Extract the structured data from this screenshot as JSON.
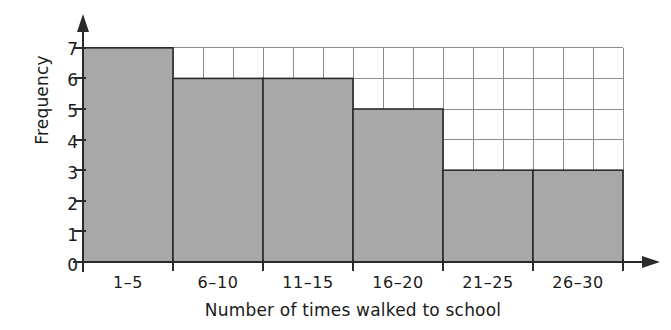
{
  "chart_data": {
    "type": "bar",
    "title": "",
    "subtitle": "",
    "xlabel": "Number of times walked to school",
    "ylabel": "Frequency",
    "categories": [
      "1–5",
      "6–10",
      "11–15",
      "16–20",
      "21–25",
      "26–30"
    ],
    "values": [
      7,
      6,
      6,
      5,
      3,
      3
    ],
    "ylim": [
      0,
      7
    ],
    "y_ticks": [
      0,
      1,
      2,
      3,
      4,
      5,
      6,
      7
    ],
    "y_tick_labels": [
      "0",
      "1",
      "2",
      "3",
      "4",
      "5",
      "6",
      "7"
    ],
    "grid": true,
    "grid_note": "square grid, 1 frequency unit tall by one-third class-width wide",
    "legend": "none",
    "bar_fill": "#a8a8a8",
    "bar_edge": "#2b2b2b",
    "grid_color": "#8c8c8c",
    "axis_color": "#2b2b2b",
    "text_color": "#1a1a1a",
    "background": "#ffffff",
    "annotations": []
  },
  "axes": {
    "y_title": "Frequency",
    "x_title": "Number of times walked to school"
  }
}
